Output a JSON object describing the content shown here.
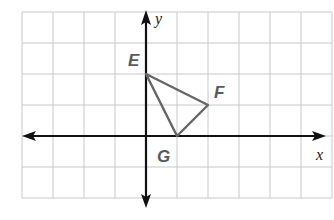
{
  "figure": {
    "type": "coordinate-plane",
    "axes": {
      "x_label": "x",
      "y_label": "y"
    },
    "grid": {
      "x_min": -4,
      "x_max": 6,
      "y_min": -2,
      "y_max": 4,
      "unit_px": 31
    },
    "points": [
      {
        "label": "E",
        "x": 0,
        "y": 2
      },
      {
        "label": "F",
        "x": 2,
        "y": 1
      },
      {
        "label": "G",
        "x": 1,
        "y": 0
      }
    ],
    "polygon": [
      "E",
      "F",
      "G"
    ],
    "colors": {
      "grid": "#c8c8c8",
      "axis": "#111111",
      "triangle": "#666666",
      "labels": "#5a5a5a"
    }
  }
}
